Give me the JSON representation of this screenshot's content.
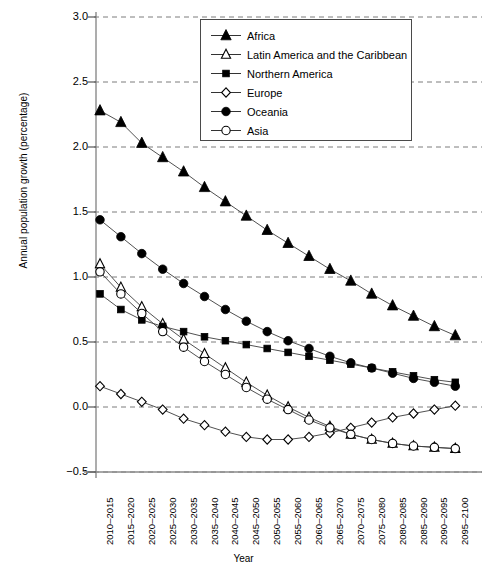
{
  "chart_data": {
    "type": "line",
    "title": "",
    "xlabel": "Year",
    "ylabel": "Annual population growth (percentage)",
    "ylim": [
      -0.5,
      3.0
    ],
    "yticks": [
      "3.0",
      "2.5",
      "2.0",
      "1.5",
      "1.0",
      "0.5",
      "0.0",
      "−0.5"
    ],
    "ytick_values": [
      3.0,
      2.5,
      2.0,
      1.5,
      1.0,
      0.5,
      0.0,
      -0.5
    ],
    "grid": "horizontal-dashed",
    "legend_position": "top-right-inside",
    "categories": [
      "2010–2015",
      "2015–2020",
      "2020–2025",
      "2025–2030",
      "2030–2035",
      "2035–2040",
      "2040–2045",
      "2045–2050",
      "2050–2055",
      "2055–2060",
      "2060–2065",
      "2065–2070",
      "2070–2075",
      "2075–2080",
      "2080–2085",
      "2085–2090",
      "2090–2095",
      "2095–2100"
    ],
    "series": [
      {
        "name": "Africa",
        "marker": "filled-triangle",
        "values": [
          2.28,
          2.19,
          2.03,
          1.92,
          1.81,
          1.69,
          1.58,
          1.47,
          1.36,
          1.26,
          1.16,
          1.06,
          0.97,
          0.87,
          0.78,
          0.7,
          0.62,
          0.55
        ]
      },
      {
        "name": "Latin America and the Caribbean",
        "marker": "open-triangle",
        "values": [
          1.1,
          0.92,
          0.77,
          0.64,
          0.52,
          0.41,
          0.3,
          0.19,
          0.09,
          0.0,
          -0.08,
          -0.15,
          -0.21,
          -0.25,
          -0.28,
          -0.3,
          -0.31,
          -0.32
        ]
      },
      {
        "name": "Northern America",
        "marker": "filled-square",
        "values": [
          0.87,
          0.75,
          0.67,
          0.62,
          0.58,
          0.54,
          0.51,
          0.48,
          0.45,
          0.42,
          0.39,
          0.36,
          0.33,
          0.3,
          0.27,
          0.24,
          0.21,
          0.19
        ]
      },
      {
        "name": "Europe",
        "marker": "open-diamond",
        "values": [
          0.16,
          0.1,
          0.04,
          -0.02,
          -0.09,
          -0.14,
          -0.19,
          -0.23,
          -0.25,
          -0.25,
          -0.23,
          -0.2,
          -0.16,
          -0.12,
          -0.08,
          -0.05,
          -0.02,
          0.01
        ]
      },
      {
        "name": "Oceania",
        "marker": "filled-circle",
        "values": [
          1.44,
          1.31,
          1.18,
          1.06,
          0.95,
          0.85,
          0.75,
          0.66,
          0.58,
          0.51,
          0.45,
          0.39,
          0.34,
          0.3,
          0.26,
          0.22,
          0.19,
          0.16
        ]
      },
      {
        "name": "Asia",
        "marker": "open-circle",
        "values": [
          1.04,
          0.87,
          0.72,
          0.58,
          0.46,
          0.35,
          0.25,
          0.15,
          0.06,
          -0.02,
          -0.1,
          -0.16,
          -0.21,
          -0.25,
          -0.28,
          -0.3,
          -0.31,
          -0.32
        ]
      }
    ]
  },
  "axis": {
    "y_title": "Annual population growth (percentage)",
    "x_title": "Year"
  },
  "legend": {
    "items": [
      {
        "label": "Africa"
      },
      {
        "label": "Latin America and the Caribbean"
      },
      {
        "label": "Northern America"
      },
      {
        "label": "Europe"
      },
      {
        "label": "Oceania"
      },
      {
        "label": "Asia"
      }
    ]
  },
  "colors": {
    "line": "#3d3d3d",
    "marker_fill": "#000000",
    "grid": "#7d7d7d",
    "axis": "#8a8a8a",
    "background": "#ffffff"
  }
}
